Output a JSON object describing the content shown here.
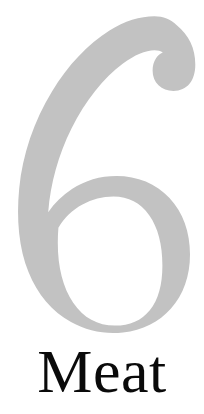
{
  "page": {
    "type": "chapter-opening-page",
    "background_color": "#ffffff",
    "width": 204,
    "height": 414
  },
  "chapter": {
    "number": "6",
    "number_color": "#c2c2c2",
    "number_glyph_name": "numeral-six",
    "title": "Meat",
    "title_color": "#0a0a0a"
  }
}
